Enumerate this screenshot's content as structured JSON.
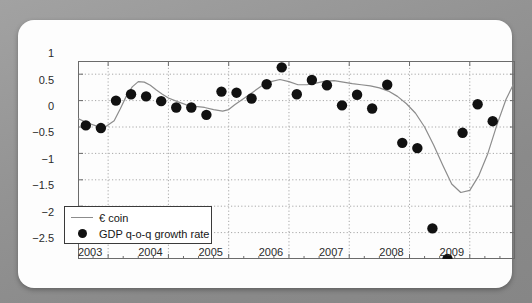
{
  "chart_data": {
    "type": "line",
    "title": "",
    "subtitle": "",
    "xlabel": "",
    "ylabel": "",
    "xlim": [
      2002.5,
      2009.75
    ],
    "ylim": [
      -2.5,
      1.25
    ],
    "grid": true,
    "grid_style": "dotted",
    "legend_position": "lower-left",
    "y_ticks": [
      "1",
      "0.5",
      "0",
      "-0.5",
      "-1",
      "-1.5",
      "-2",
      "-2.5"
    ],
    "y_tick_values": [
      1,
      0.5,
      0,
      -0.5,
      -1,
      -1.5,
      -2,
      -2.5
    ],
    "x_ticks": [
      "2003",
      "2004",
      "2005",
      "2006",
      "2007",
      "2008",
      "2009"
    ],
    "x_tick_values": [
      2003,
      2004,
      2005,
      2006,
      2007,
      2008,
      2009
    ],
    "series": [
      {
        "name": "€ coin",
        "type": "line",
        "color": "#8c8c8c",
        "x": [
          2002.5,
          2002.65,
          2002.8,
          2002.95,
          2003.1,
          2003.2,
          2003.3,
          2003.4,
          2003.5,
          2003.6,
          2003.7,
          2003.8,
          2003.9,
          2004.0,
          2004.15,
          2004.3,
          2004.45,
          2004.6,
          2004.75,
          2004.9,
          2005.0,
          2005.1,
          2005.25,
          2005.4,
          2005.55,
          2005.7,
          2005.85,
          2006.0,
          2006.15,
          2006.3,
          2006.45,
          2006.6,
          2006.75,
          2006.9,
          2007.05,
          2007.2,
          2007.35,
          2007.5,
          2007.65,
          2007.8,
          2007.95,
          2008.1,
          2008.25,
          2008.4,
          2008.55,
          2008.7,
          2008.85,
          2009.0,
          2009.15,
          2009.3,
          2009.45,
          2009.6,
          2009.72
        ],
        "y": [
          0.16,
          0.08,
          0.02,
          0.0,
          0.12,
          0.34,
          0.58,
          0.76,
          0.86,
          0.85,
          0.79,
          0.7,
          0.62,
          0.55,
          0.48,
          0.42,
          0.39,
          0.37,
          0.33,
          0.3,
          0.33,
          0.42,
          0.54,
          0.66,
          0.78,
          0.86,
          0.9,
          0.86,
          0.8,
          0.8,
          0.83,
          0.87,
          0.88,
          0.85,
          0.82,
          0.8,
          0.78,
          0.74,
          0.68,
          0.58,
          0.44,
          0.26,
          0.0,
          -0.34,
          -0.72,
          -1.08,
          -1.24,
          -1.2,
          -0.92,
          -0.5,
          0.04,
          0.52,
          0.8
        ]
      },
      {
        "name": "GDP q-o-q growth rate",
        "type": "scatter",
        "color": "#111111",
        "x": [
          2002.63,
          2002.88,
          2003.13,
          2003.38,
          2003.63,
          2003.88,
          2004.13,
          2004.38,
          2004.63,
          2004.88,
          2005.13,
          2005.38,
          2005.63,
          2005.88,
          2006.13,
          2006.38,
          2006.63,
          2006.88,
          2007.13,
          2007.38,
          2007.63,
          2007.88,
          2008.13,
          2008.38,
          2008.63,
          2008.88,
          2009.13,
          2009.38
        ],
        "y": [
          0.03,
          -0.02,
          0.5,
          0.62,
          0.58,
          0.49,
          0.37,
          0.37,
          0.23,
          0.67,
          0.65,
          0.54,
          0.81,
          1.13,
          0.62,
          0.89,
          0.79,
          0.41,
          0.61,
          0.35,
          0.8,
          -0.3,
          -0.4,
          -1.92,
          -2.5,
          -0.11,
          0.43,
          0.11
        ]
      }
    ]
  },
  "legend": {
    "entries": [
      {
        "label": "€ coin",
        "symbol": "line",
        "color": "#8c8c8c"
      },
      {
        "label": "GDP q-o-q growth rate",
        "symbol": "dot",
        "color": "#111111"
      }
    ]
  },
  "colors": {
    "background": "#8f8f8f",
    "card": "#fdfdfd",
    "line": "#8c8c8c",
    "marker": "#111111",
    "axis": "#6b6b6b",
    "grid": "#a8a8a8",
    "text": "#2a2a2a"
  }
}
